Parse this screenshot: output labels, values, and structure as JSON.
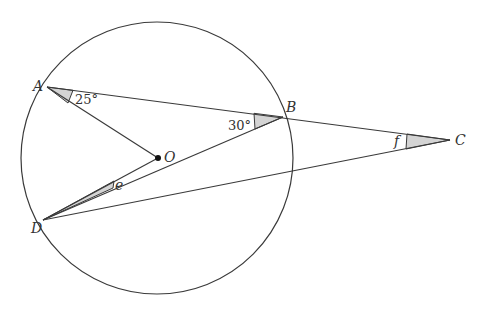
{
  "diagram": {
    "type": "circle-geometry",
    "circle": {
      "center_label": "O",
      "cx": 157,
      "cy": 158,
      "r": 136
    },
    "points": {
      "A": {
        "label": "A",
        "x": 47,
        "y": 87
      },
      "B": {
        "label": "B",
        "x": 283,
        "y": 117
      },
      "C": {
        "label": "C",
        "x": 450,
        "y": 140
      },
      "D": {
        "label": "D",
        "x": 43,
        "y": 220
      },
      "O": {
        "label": "O",
        "x": 158,
        "y": 158
      }
    },
    "segments": [
      "A-C",
      "A-O",
      "D-B",
      "D-C",
      "D-O"
    ],
    "angles": {
      "OAB": {
        "label": "25°"
      },
      "ABD": {
        "label": "30°"
      },
      "ODB": {
        "label": "e"
      },
      "BCD": {
        "label": "f"
      }
    },
    "colors": {
      "line": "#3a3a3a",
      "shade": "#d4d4d4"
    }
  }
}
